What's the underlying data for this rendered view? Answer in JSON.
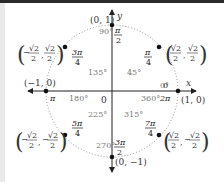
{
  "diagram": {
    "axes": {
      "x_label": "x",
      "y_label": "y",
      "origin_label": "0"
    },
    "points": [
      {
        "angle_deg": "0°",
        "alt_deg": "360°",
        "radian": "0",
        "alt_radian": "2π",
        "coord": "(1, 0)"
      },
      {
        "angle_deg": "45°",
        "radian_num": "π",
        "radian_den": "4",
        "coord_x": "√2/2",
        "coord_y": "√2/2"
      },
      {
        "angle_deg": "90°",
        "radian_num": "π",
        "radian_den": "2",
        "coord": "(0, 1)"
      },
      {
        "angle_deg": "135°",
        "radian_num": "3π",
        "radian_den": "4",
        "coord_x": "−√2/2",
        "coord_y": "√2/2"
      },
      {
        "angle_deg": "180°",
        "radian": "π",
        "coord": "(−1, 0)"
      },
      {
        "angle_deg": "225°",
        "radian_num": "5π",
        "radian_den": "4",
        "coord_x": "−√2/2",
        "coord_y": "−√2/2"
      },
      {
        "angle_deg": "270°",
        "radian_num": "3π",
        "radian_den": "2",
        "coord": "(0, −1)"
      },
      {
        "angle_deg": "315°",
        "radian_num": "7π",
        "radian_den": "4",
        "coord_x": "√2/2",
        "coord_y": "−√2/2"
      }
    ],
    "colors": {
      "topbar": "#2b2b2b",
      "leftstrip": "#e9e9e9",
      "circle": "#888888",
      "axis": "#222222"
    }
  }
}
